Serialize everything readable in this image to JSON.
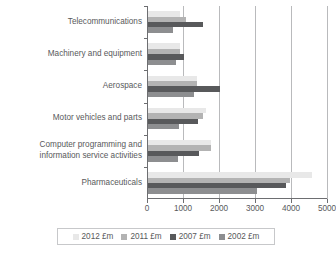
{
  "chart_data": {
    "type": "bar",
    "orientation": "horizontal",
    "title": "",
    "xlabel": "",
    "ylabel": "",
    "xlim": [
      0,
      5000
    ],
    "xticks": [
      0,
      1000,
      2000,
      3000,
      4000,
      5000
    ],
    "xtick_labels": [
      "0",
      "1000",
      "2000",
      "3000",
      "4000",
      "5000"
    ],
    "grid": true,
    "grid_axis": "x",
    "legend_position": "bottom",
    "categories": [
      "Telecommunications",
      "Machinery and equipment",
      "Aerospace",
      "Motor vehicles and parts",
      "Computer programming and\ninformation service activities",
      "Pharmaceuticals"
    ],
    "series": [
      {
        "name": "2012 £m",
        "color": "#e8e8e8",
        "values": [
          900,
          890,
          1350,
          1600,
          1740,
          4550
        ]
      },
      {
        "name": "2011 £m",
        "color": "#b3b3b3",
        "values": [
          1050,
          900,
          1360,
          1540,
          1760,
          3950
        ]
      },
      {
        "name": "2007 £m",
        "color": "#58595b",
        "values": [
          1520,
          1010,
          2000,
          1400,
          1420,
          3830
        ]
      },
      {
        "name": "2002 £m",
        "color": "#8d8e90",
        "values": [
          700,
          780,
          1270,
          860,
          820,
          3030
        ]
      }
    ]
  },
  "legend": {
    "items": [
      {
        "label": "2012 £m",
        "color": "#e8e8e8"
      },
      {
        "label": "2011 £m",
        "color": "#b3b3b3"
      },
      {
        "label": "2007 £m",
        "color": "#58595b"
      },
      {
        "label": "2002 £m",
        "color": "#8d8e90"
      }
    ]
  },
  "colors": {
    "axis": "#6d6e71",
    "gridline": "#b9babc",
    "text": "#58595b",
    "background": "#ffffff",
    "legend_border": "#c7c8ca"
  }
}
